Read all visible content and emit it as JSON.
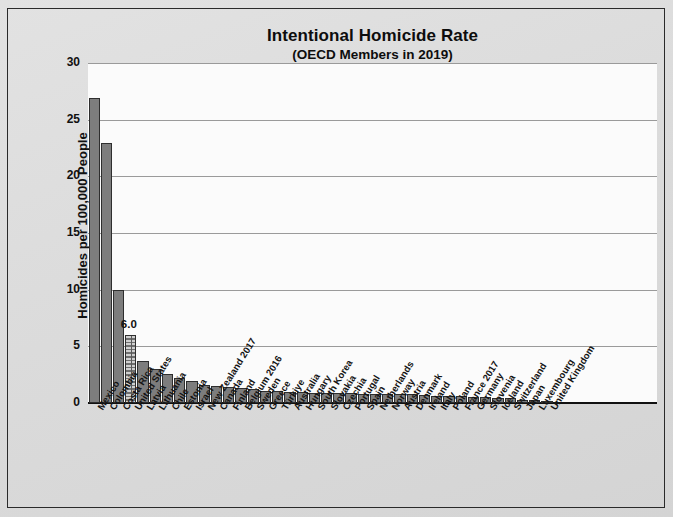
{
  "chart_data": {
    "type": "bar",
    "title": "Intentional Homicide Rate",
    "subtitle": "(OECD Members in 2019)",
    "xlabel": "",
    "ylabel": "Homicides per 100,000 People",
    "ylim": [
      0,
      30
    ],
    "yticks": [
      0,
      5,
      10,
      15,
      20,
      25,
      30
    ],
    "grid": true,
    "legend": "none",
    "bar_color": "#7d7d7d",
    "bar_edge_color": "#2e2e2e",
    "highlight_index": 3,
    "highlight_label": "6.0",
    "categories": [
      "Mexico",
      "Colombia",
      "Costa Rica",
      "United States",
      "Latvia",
      "Lithuania",
      "Chile",
      "Estonia",
      "Israel",
      "New Zealand 2017",
      "Canada",
      "Finland",
      "Belgium 2016",
      "Sweden",
      "Greece",
      "Türkiye",
      "Australia",
      "Hungary",
      "South Korea",
      "Slovakia",
      "Czechia",
      "Portugal",
      "Spain",
      "Netherlands",
      "Norway",
      "Austria",
      "Denmark",
      "Ireland",
      "Italy",
      "Poland",
      "France 2017",
      "Germany",
      "Slovenia",
      "Iceland",
      "Switzerland",
      "Japan",
      "Luxembourg",
      "United Kingdom"
    ],
    "values": [
      26.9,
      22.9,
      10.0,
      6.0,
      3.7,
      3.0,
      2.6,
      2.2,
      1.9,
      1.6,
      1.5,
      1.4,
      1.3,
      1.2,
      1.1,
      1.1,
      1.0,
      1.0,
      0.9,
      0.9,
      0.9,
      0.9,
      0.8,
      0.8,
      0.8,
      0.8,
      0.8,
      0.7,
      0.6,
      0.6,
      0.6,
      0.5,
      0.5,
      0.4,
      0.4,
      0.3,
      0.3,
      0.2
    ]
  }
}
